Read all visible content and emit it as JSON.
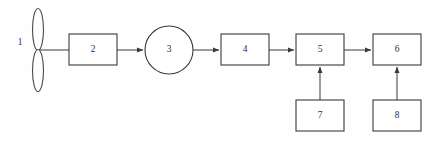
{
  "diagram": {
    "canvas": {
      "width": 438,
      "height": 142,
      "background": "#fefefe"
    },
    "stroke_color": "#4a4a4a",
    "box_stroke_color": "#3a3a3a",
    "label_color": "#2e2e2e",
    "fill_color": "#ffffff",
    "nodes": [
      {
        "id": "1",
        "label": "1",
        "shape": "turbine-rotor",
        "label_position": "left-outside",
        "cx": 38,
        "cy": 50,
        "label_x": 20,
        "label_y": 43,
        "blade_rx": 5.5,
        "blade_ry": 21
      },
      {
        "id": "2",
        "label": "2",
        "shape": "rect",
        "x": 69,
        "y": 34,
        "width": 48,
        "height": 31,
        "label_x": 93,
        "label_y": 50
      },
      {
        "id": "3",
        "label": "3",
        "shape": "circle",
        "cx": 169,
        "cy": 50,
        "r": 24,
        "label_x": 169,
        "label_y": 50
      },
      {
        "id": "4",
        "label": "4",
        "shape": "rect",
        "x": 221,
        "y": 34,
        "width": 48,
        "height": 31,
        "label_x": 245,
        "label_y": 50
      },
      {
        "id": "5",
        "label": "5",
        "shape": "rect",
        "x": 296,
        "y": 34,
        "width": 48,
        "height": 31,
        "label_x": 320,
        "label_y": 50
      },
      {
        "id": "6",
        "label": "6",
        "shape": "rect",
        "x": 373,
        "y": 34,
        "width": 48,
        "height": 31,
        "label_x": 397,
        "label_y": 50
      },
      {
        "id": "7",
        "label": "7",
        "shape": "rect",
        "x": 296,
        "y": 100,
        "width": 48,
        "height": 31,
        "label_x": 320,
        "label_y": 116
      },
      {
        "id": "8",
        "label": "8",
        "shape": "rect",
        "x": 373,
        "y": 100,
        "width": 48,
        "height": 31,
        "label_x": 397,
        "label_y": 116
      }
    ],
    "connectors": [
      {
        "from": "1",
        "to": "2",
        "arrow": false,
        "path": "M 38 50 L 69 50"
      },
      {
        "from": "2",
        "to": "3",
        "arrow": true,
        "path": "M 117 50 L 143 50"
      },
      {
        "from": "3",
        "to": "4",
        "arrow": true,
        "path": "M 193 50 L 219 50"
      },
      {
        "from": "4",
        "to": "5",
        "arrow": true,
        "path": "M 269 50 L 294 50"
      },
      {
        "from": "5",
        "to": "6",
        "arrow": true,
        "path": "M 344 50 L 371 50"
      },
      {
        "from": "7",
        "to": "5",
        "arrow": true,
        "path": "M 320 100 L 320 67"
      },
      {
        "from": "8",
        "to": "6",
        "arrow": true,
        "path": "M 397 100 L 397 67"
      }
    ]
  }
}
